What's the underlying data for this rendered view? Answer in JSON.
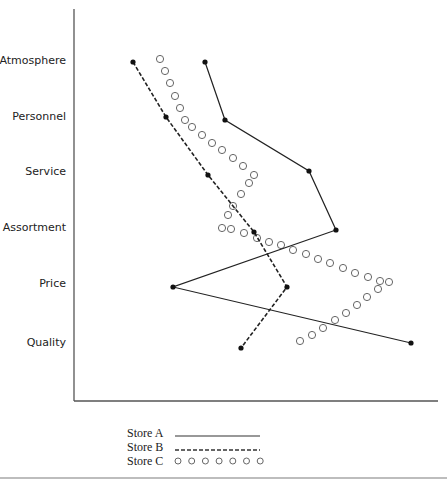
{
  "chart_data": {
    "type": "line",
    "title": "",
    "xlabel": "",
    "ylabel": "",
    "orientation": "horizontal-profile",
    "grid": false,
    "legend_position": "bottom",
    "categories": [
      "Atmosphere",
      "Personnel",
      "Service",
      "Assortment",
      "Price",
      "Quality"
    ],
    "x_scale_note": "Unlabeled rating scale (pixel x-position of each point, axis from 74 to 438)",
    "series": [
      {
        "name": "Store A",
        "style": "solid",
        "color": "#222222",
        "points": [
          {
            "category": "Atmosphere",
            "x": 205,
            "y": 62
          },
          {
            "category": "Personnel",
            "x": 225,
            "y": 120
          },
          {
            "category": "Service",
            "x": 309,
            "y": 171
          },
          {
            "category": "Assortment",
            "x": 336,
            "y": 230
          },
          {
            "category": "Price",
            "x": 173,
            "y": 287
          },
          {
            "category": "Quality",
            "x": 411,
            "y": 343
          }
        ]
      },
      {
        "name": "Store B",
        "style": "dashed",
        "color": "#222222",
        "points": [
          {
            "category": "Atmosphere",
            "x": 133,
            "y": 62
          },
          {
            "category": "Personnel",
            "x": 166,
            "y": 117
          },
          {
            "category": "Service",
            "x": 208,
            "y": 175
          },
          {
            "category": "Assortment",
            "x": 254,
            "y": 232
          },
          {
            "category": "Price",
            "x": 287,
            "y": 287
          },
          {
            "category": "Quality",
            "x": 241,
            "y": 348
          }
        ]
      },
      {
        "name": "Store C",
        "style": "circles",
        "color": "#555555",
        "points": [
          {
            "category": "Atmosphere",
            "x": 160,
            "y": 59
          },
          {
            "category": "Personnel",
            "x": 185,
            "y": 120
          },
          {
            "category": "Service",
            "x": 254,
            "y": 175
          },
          {
            "category": "Assortment",
            "x": 222,
            "y": 228
          },
          {
            "category": "Price",
            "x": 389,
            "y": 281
          },
          {
            "category": "Quality",
            "x": 300,
            "y": 341
          }
        ]
      }
    ],
    "legend": [
      {
        "label": "Store A",
        "style": "solid"
      },
      {
        "label": "Store B",
        "style": "dashed"
      },
      {
        "label": "Store C",
        "style": "circles"
      }
    ]
  },
  "axis": {
    "x0": 74,
    "x1": 438,
    "y0": 9,
    "y1": 401
  },
  "category_label_y": [
    60,
    116,
    171,
    227,
    283,
    342
  ],
  "store_c_circles": [
    [
      160,
      59
    ],
    [
      165,
      71
    ],
    [
      170,
      83
    ],
    [
      175,
      96
    ],
    [
      180,
      108
    ],
    [
      185,
      120
    ],
    [
      192,
      127
    ],
    [
      202,
      135
    ],
    [
      212,
      143
    ],
    [
      222,
      150
    ],
    [
      233,
      158
    ],
    [
      243,
      166
    ],
    [
      254,
      175
    ],
    [
      249,
      183
    ],
    [
      241,
      194
    ],
    [
      233,
      206
    ],
    [
      228,
      215
    ],
    [
      222,
      228
    ],
    [
      231,
      229
    ],
    [
      244,
      233
    ],
    [
      257,
      238
    ],
    [
      269,
      242
    ],
    [
      281,
      245
    ],
    [
      293,
      250
    ],
    [
      306,
      254
    ],
    [
      318,
      259
    ],
    [
      330,
      263
    ],
    [
      343,
      268
    ],
    [
      355,
      273
    ],
    [
      368,
      277
    ],
    [
      380,
      281
    ],
    [
      389,
      282
    ],
    [
      378,
      289
    ],
    [
      367,
      297
    ],
    [
      357,
      305
    ],
    [
      346,
      313
    ],
    [
      335,
      320
    ],
    [
      323,
      328
    ],
    [
      312,
      335
    ],
    [
      300,
      341
    ]
  ]
}
